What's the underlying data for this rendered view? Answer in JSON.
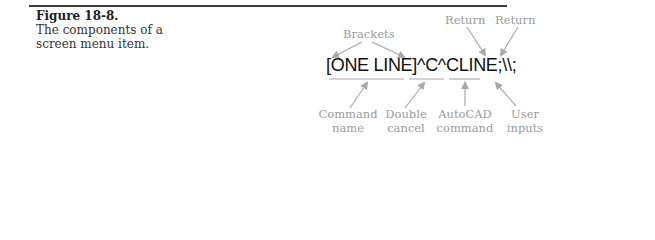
{
  "figure": {
    "number": "Figure 18-8.",
    "caption_line1": "The components of a",
    "caption_line2": "screen menu item."
  },
  "diagram": {
    "menu_item_text": "[ONE LINE]^C^CLINE;\\\\;",
    "top_labels": {
      "brackets": "Brackets",
      "return_1": "Return",
      "return_2": "Return"
    },
    "bottom_labels": [
      {
        "line1": "Command",
        "line2": "name"
      },
      {
        "line1": "Double",
        "line2": "cancel"
      },
      {
        "line1": "AutoCAD",
        "line2": "command"
      },
      {
        "line1": "User",
        "line2": "inputs"
      }
    ],
    "colors": {
      "rule": "#3a3a3a",
      "label": "#9a9a9a",
      "arrow": "#a8a8a8",
      "main_text": "#111111"
    }
  }
}
